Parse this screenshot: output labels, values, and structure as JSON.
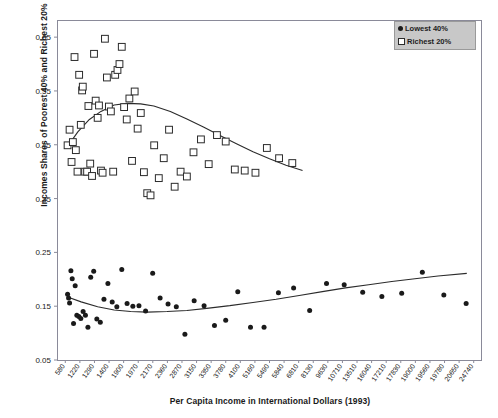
{
  "chart_data": {
    "type": "scatter",
    "title": "",
    "xlabel": "Per Capita Income in International Dollars (1993)",
    "ylabel": "Incomes Shares of Poorest 40% and Richest 20%",
    "grid": false,
    "legend_position": "top-right",
    "ylim": [
      0.05,
      0.68
    ],
    "yticks": [
      "0.05",
      "0.15",
      "0.25",
      "0.35",
      "0.45",
      "0.55",
      "0.65"
    ],
    "ytick_values": [
      0.05,
      0.15,
      0.25,
      0.35,
      0.45,
      0.55,
      0.65
    ],
    "xtick_labels": [
      "580",
      "1220",
      "1290",
      "1400",
      "1900",
      "1970",
      "2170",
      "2360",
      "2870",
      "3150",
      "3350",
      "3780",
      "4100",
      "5160",
      "5490",
      "5840",
      "6810",
      "8130",
      "9630",
      "10710",
      "13510",
      "16040",
      "17210",
      "17830",
      "19000",
      "19560",
      "19780",
      "20650",
      "24740"
    ],
    "legend": [
      {
        "label": "Lowest 40%",
        "marker": "filled-circle",
        "color": "#1a1a1a"
      },
      {
        "label": "Richest 20%",
        "marker": "open-square",
        "color": "#2b2b2b"
      }
    ],
    "series": [
      {
        "name": "Richest 20%",
        "marker": "open-square",
        "points": [
          [
            580,
            0.449
          ],
          [
            700,
            0.478
          ],
          [
            820,
            0.418
          ],
          [
            900,
            0.455
          ],
          [
            1000,
            0.613
          ],
          [
            1080,
            0.44
          ],
          [
            1180,
            0.4
          ],
          [
            1280,
            0.58
          ],
          [
            1380,
            0.487
          ],
          [
            1460,
            0.551
          ],
          [
            1500,
            0.558
          ],
          [
            1640,
            0.4
          ],
          [
            1760,
            0.4
          ],
          [
            1840,
            0.522
          ],
          [
            1950,
            0.415
          ],
          [
            2060,
            0.392
          ],
          [
            2180,
            0.619
          ],
          [
            2280,
            0.532
          ],
          [
            2400,
            0.5
          ],
          [
            2480,
            0.523
          ],
          [
            2600,
            0.402
          ],
          [
            2700,
            0.398
          ],
          [
            2840,
            0.647
          ],
          [
            2960,
            0.575
          ],
          [
            3080,
            0.521
          ],
          [
            3200,
            0.512
          ],
          [
            3340,
            0.4
          ],
          [
            3460,
            0.58
          ],
          [
            3600,
            0.589
          ],
          [
            3720,
            0.6
          ],
          [
            3860,
            0.632
          ],
          [
            4000,
            0.52
          ],
          [
            4160,
            0.497
          ],
          [
            4320,
            0.536
          ],
          [
            4480,
            0.42
          ],
          [
            4640,
            0.549
          ],
          [
            4820,
            0.48
          ],
          [
            5010,
            0.509
          ],
          [
            5200,
            0.399
          ],
          [
            5400,
            0.36
          ],
          [
            5600,
            0.356
          ],
          [
            5820,
            0.449
          ],
          [
            6100,
            0.388
          ],
          [
            6400,
            0.425
          ],
          [
            6720,
            0.478
          ],
          [
            7060,
            0.372
          ],
          [
            7420,
            0.4
          ],
          [
            7800,
            0.391
          ],
          [
            8200,
            0.436
          ],
          [
            8650,
            0.46
          ],
          [
            9120,
            0.414
          ],
          [
            9620,
            0.468
          ],
          [
            10150,
            0.456
          ],
          [
            10700,
            0.404
          ],
          [
            11300,
            0.402
          ],
          [
            11950,
            0.398
          ],
          [
            12640,
            0.444
          ],
          [
            13380,
            0.425
          ],
          [
            14180,
            0.416
          ]
        ]
      },
      {
        "name": "Lowest 40%",
        "marker": "filled-circle",
        "points": [
          [
            580,
            0.172
          ],
          [
            640,
            0.165
          ],
          [
            700,
            0.156
          ],
          [
            780,
            0.216
          ],
          [
            860,
            0.201
          ],
          [
            940,
            0.118
          ],
          [
            1040,
            0.188
          ],
          [
            1140,
            0.133
          ],
          [
            1260,
            0.131
          ],
          [
            1380,
            0.127
          ],
          [
            1520,
            0.14
          ],
          [
            1660,
            0.133
          ],
          [
            1810,
            0.111
          ],
          [
            1980,
            0.204
          ],
          [
            2160,
            0.215
          ],
          [
            2350,
            0.126
          ],
          [
            2560,
            0.12
          ],
          [
            2780,
            0.163
          ],
          [
            3020,
            0.192
          ],
          [
            3280,
            0.158
          ],
          [
            3560,
            0.149
          ],
          [
            3860,
            0.218
          ],
          [
            4180,
            0.155
          ],
          [
            4530,
            0.15
          ],
          [
            4900,
            0.151
          ],
          [
            5300,
            0.141
          ],
          [
            5730,
            0.211
          ],
          [
            6180,
            0.165
          ],
          [
            6660,
            0.154
          ],
          [
            7160,
            0.149
          ],
          [
            7680,
            0.098
          ],
          [
            8240,
            0.16
          ],
          [
            8840,
            0.151
          ],
          [
            9470,
            0.114
          ],
          [
            10150,
            0.124
          ],
          [
            10880,
            0.177
          ],
          [
            11650,
            0.111
          ],
          [
            12470,
            0.111
          ],
          [
            13340,
            0.175
          ],
          [
            14260,
            0.184
          ],
          [
            15230,
            0.142
          ],
          [
            16250,
            0.192
          ],
          [
            17320,
            0.19
          ],
          [
            18440,
            0.176
          ],
          [
            19600,
            0.168
          ],
          [
            20800,
            0.174
          ],
          [
            22050,
            0.213
          ],
          [
            23350,
            0.171
          ],
          [
            24700,
            0.155
          ]
        ]
      }
    ],
    "trend_lines": [
      {
        "name": "Richest 20% fitted curve",
        "points": [
          [
            580,
            0.447
          ],
          [
            1200,
            0.474
          ],
          [
            1900,
            0.497
          ],
          [
            2600,
            0.512
          ],
          [
            3400,
            0.524
          ],
          [
            4200,
            0.527
          ],
          [
            5000,
            0.526
          ],
          [
            5800,
            0.522
          ],
          [
            6800,
            0.512
          ],
          [
            7800,
            0.498
          ],
          [
            8800,
            0.483
          ],
          [
            9800,
            0.467
          ],
          [
            10800,
            0.452
          ],
          [
            11800,
            0.437
          ],
          [
            12800,
            0.424
          ],
          [
            13800,
            0.412
          ],
          [
            14800,
            0.402
          ]
        ]
      },
      {
        "name": "Lowest 40% fitted curve",
        "points": [
          [
            580,
            0.167
          ],
          [
            1400,
            0.158
          ],
          [
            2400,
            0.149
          ],
          [
            3400,
            0.143
          ],
          [
            4400,
            0.14
          ],
          [
            5400,
            0.139
          ],
          [
            6600,
            0.14
          ],
          [
            7800,
            0.142
          ],
          [
            9000,
            0.146
          ],
          [
            10400,
            0.151
          ],
          [
            11800,
            0.157
          ],
          [
            13200,
            0.163
          ],
          [
            14600,
            0.17
          ],
          [
            16000,
            0.177
          ],
          [
            17400,
            0.184
          ],
          [
            18800,
            0.19
          ],
          [
            20200,
            0.196
          ],
          [
            21600,
            0.201
          ],
          [
            23000,
            0.206
          ],
          [
            24740,
            0.211
          ]
        ]
      }
    ]
  },
  "colors": {
    "axis": "#8a8a99",
    "marker_open": "#2b2b2b",
    "marker_filled": "#1a1a1a",
    "trend": "#2b2b2b",
    "legend_bg": "#c8c8c8",
    "text": "#1a1a1a"
  }
}
